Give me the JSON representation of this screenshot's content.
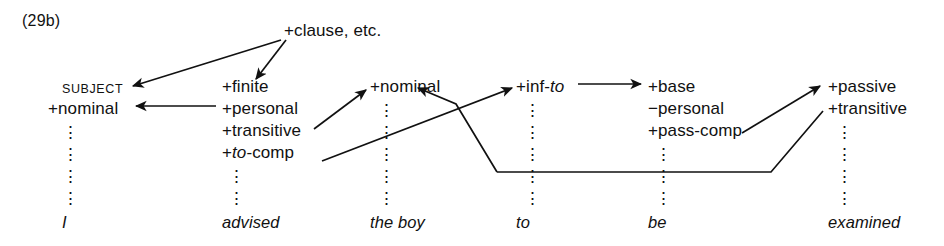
{
  "figure": {
    "example_number": "(29b)",
    "root": {
      "label": "+clause, etc.",
      "x": 284,
      "y": 30
    },
    "vertical_dots_glyph": "⋮",
    "columns": [
      {
        "id": "col-subject",
        "x": 62,
        "header": "SUBJECT",
        "header_style": "smallcaps",
        "features": [
          "+nominal"
        ],
        "dots_rows": [
          3,
          4,
          5,
          6
        ],
        "word": "I"
      },
      {
        "id": "col-advised",
        "x": 222,
        "header": "+finite",
        "header_style": "feature",
        "features": [
          "+personal",
          "+transitive",
          "+to-comp"
        ],
        "features_html": [
          "+personal",
          "+transitive",
          "+<i>to</i>-comp"
        ],
        "dots_rows": [
          5,
          6
        ],
        "word": "advised"
      },
      {
        "id": "col-theboy",
        "x": 370,
        "header": "+nominal",
        "header_style": "feature",
        "features": [],
        "dots_rows": [
          2,
          3,
          4,
          5,
          6
        ],
        "word": "the boy"
      },
      {
        "id": "col-to",
        "x": 520,
        "header": "+inf-to",
        "header_html": "+inf-<i>to</i>",
        "header_style": "feature",
        "features": [],
        "dots_rows": [
          2,
          3,
          4,
          5,
          6
        ],
        "word": "to"
      },
      {
        "id": "col-be",
        "x": 648,
        "header": "+base",
        "header_style": "feature",
        "features": [
          "−personal",
          "+pass-comp"
        ],
        "dots_rows": [
          4,
          5,
          6
        ],
        "word": "be"
      },
      {
        "id": "col-examined",
        "x": 828,
        "header": "+passive",
        "header_style": "feature",
        "features": [
          "+transitive"
        ],
        "dots_rows": [
          3,
          4,
          5,
          6
        ],
        "word": "examined"
      }
    ],
    "row_baselines": {
      "r1": 88,
      "r2": 110,
      "r3": 132,
      "r4": 154,
      "r5": 176,
      "r6": 198,
      "words": 224
    },
    "arrows": [
      {
        "id": "clause-to-subject",
        "from": "+clause, etc.",
        "to": "SUBJECT",
        "path": "M 281 40 L 133 86",
        "arrowhead": "end"
      },
      {
        "id": "clause-to-finite",
        "from": "+clause, etc.",
        "to": "+finite",
        "path": "M 285 40 L 256 80",
        "arrowhead": "end"
      },
      {
        "id": "personal-to-nominal",
        "from": "+personal",
        "to": "+nominal (subject)",
        "path": "M 215 106 L 135 106",
        "arrowhead": "end"
      },
      {
        "id": "transitive-to-nominal-object",
        "from": "+transitive",
        "to": "+nominal (the boy)",
        "path": "M 315 128 L 366 90",
        "arrowhead": "end"
      },
      {
        "id": "to-comp-to-inf-to",
        "from": "+to-comp",
        "to": "+inf-to",
        "path": "M 322 160 L 513 87",
        "arrowhead": "end"
      },
      {
        "id": "infto-to-base",
        "from": "+inf-to",
        "to": "+base",
        "path": "M 576 83 L 641 83",
        "arrowhead": "end"
      },
      {
        "id": "passcomp-to-passive",
        "from": "+pass-comp",
        "to": "+passive",
        "path": "M 742 132 L 821 85",
        "arrowhead": "end"
      },
      {
        "id": "object-raise-to-nominal",
        "from": "+inf-to column baseline",
        "to": "+nominal (the boy)",
        "path": "M 497 172 L 456 104 L 419 87",
        "arrowhead": "end"
      },
      {
        "id": "subject-chain-to-transitive",
        "from": "+inf-to column baseline",
        "to": "+transitive (examined)",
        "path": "M 497 172 L 771 172 L 822 110",
        "arrowhead": "none"
      }
    ]
  }
}
